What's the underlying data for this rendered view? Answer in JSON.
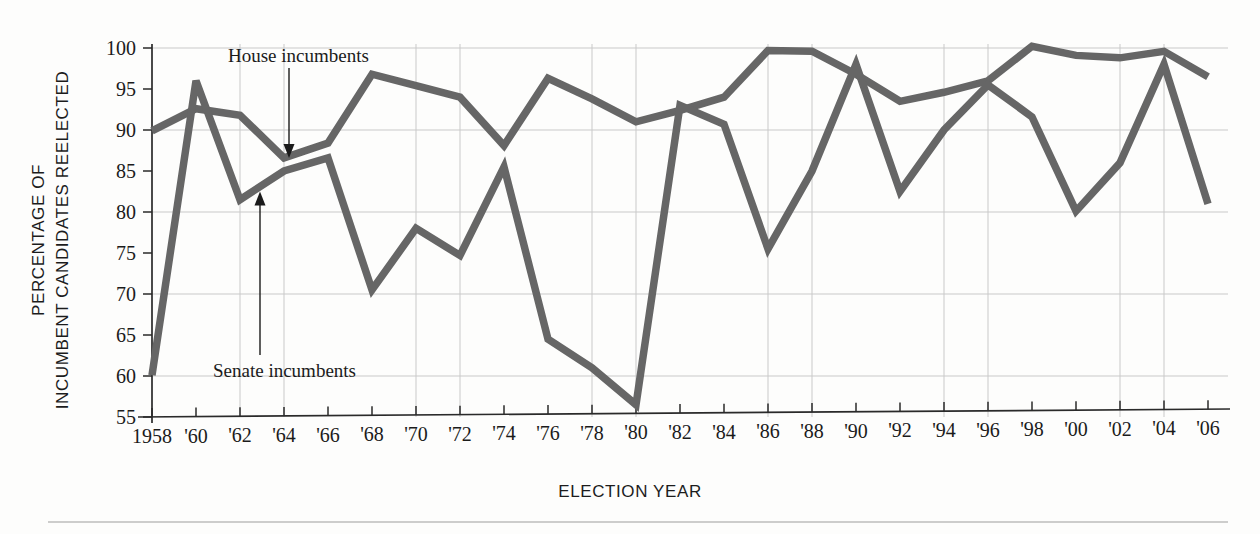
{
  "chart_data": {
    "type": "line",
    "title": "",
    "subtitle": "",
    "xlabel": "ELECTION YEAR",
    "ylabel": "PERCENTAGE OF INCUMBENT CANDIDATES REELECTED",
    "ylabel_line1": "PERCENTAGE OF",
    "ylabel_line2": "INCUMBENT CANDIDATES REELECTED",
    "grid": true,
    "legend_position": "inline-annotations",
    "xlim": [
      1958,
      2006
    ],
    "ylim": [
      55,
      100
    ],
    "yticks": [
      55,
      60,
      65,
      70,
      75,
      80,
      85,
      90,
      95,
      100
    ],
    "ytick_labels": [
      "55",
      "60",
      "65",
      "70",
      "75",
      "80",
      "85",
      "90",
      "95",
      "100"
    ],
    "x": [
      1958,
      1960,
      1962,
      1964,
      1966,
      1968,
      1970,
      1972,
      1974,
      1976,
      1978,
      1980,
      1982,
      1984,
      1986,
      1988,
      1990,
      1992,
      1994,
      1996,
      1998,
      2000,
      2002,
      2004,
      2006
    ],
    "xtick_labels": [
      "1958",
      "'60",
      "'62",
      "'64",
      "'66",
      "'68",
      "'70",
      "'72",
      "'74",
      "'76",
      "'78",
      "'80",
      "'82",
      "'84",
      "'86",
      "'88",
      "'90",
      "'92",
      "'94",
      "'96",
      "'98",
      "'00",
      "'02",
      "'04",
      "'06"
    ],
    "series": [
      {
        "name": "House incumbents",
        "color": "#666666",
        "values": [
          89.9,
          92.6,
          91.8,
          86.6,
          88.4,
          96.8,
          95.4,
          94.0,
          88.1,
          96.3,
          93.8,
          91.0,
          92.4,
          94.0,
          99.7,
          99.6,
          96.8,
          93.5,
          94.6,
          96.0,
          100.2,
          99.1,
          98.8,
          99.6,
          96.5
        ]
      },
      {
        "name": "Senate incumbents",
        "color": "#666666",
        "values": [
          60.1,
          96.0,
          81.5,
          85.0,
          86.6,
          70.5,
          78.0,
          74.7,
          85.5,
          64.5,
          61.0,
          56.5,
          93.0,
          90.7,
          75.5,
          85.0,
          98.0,
          82.5,
          90.0,
          95.5,
          91.6,
          80.1,
          86.0,
          98.0,
          81.0
        ]
      }
    ],
    "annotations": [
      {
        "text": "House incumbents",
        "points_to_year": 1964,
        "points_to_value": 86.6,
        "direction": "down"
      },
      {
        "text": "Senate incumbents",
        "points_to_year": 1962,
        "points_to_value": 82.5,
        "direction": "up"
      }
    ]
  }
}
